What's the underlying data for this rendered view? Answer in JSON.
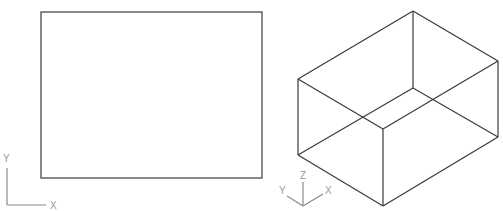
{
  "canvas": {
    "width": 503,
    "height": 211,
    "background": "#ffffff"
  },
  "colors": {
    "geometry": "#3a3a3a",
    "ucs_icon": "#8a8a8a",
    "ucs_label": "#9a9a9a"
  },
  "views": [
    {
      "name": "2D top view",
      "shape": "rectangle",
      "rect": {
        "x": 41,
        "y": 12,
        "width": 221,
        "height": 166
      },
      "ucs_icon": {
        "type": "2d",
        "labels": {
          "x": "X",
          "y": "Y"
        }
      }
    },
    {
      "name": "3D isometric view",
      "shape": "box",
      "ucs_icon": {
        "type": "3d",
        "labels": {
          "x": "X",
          "y": "Y",
          "z": "Z"
        }
      }
    }
  ]
}
